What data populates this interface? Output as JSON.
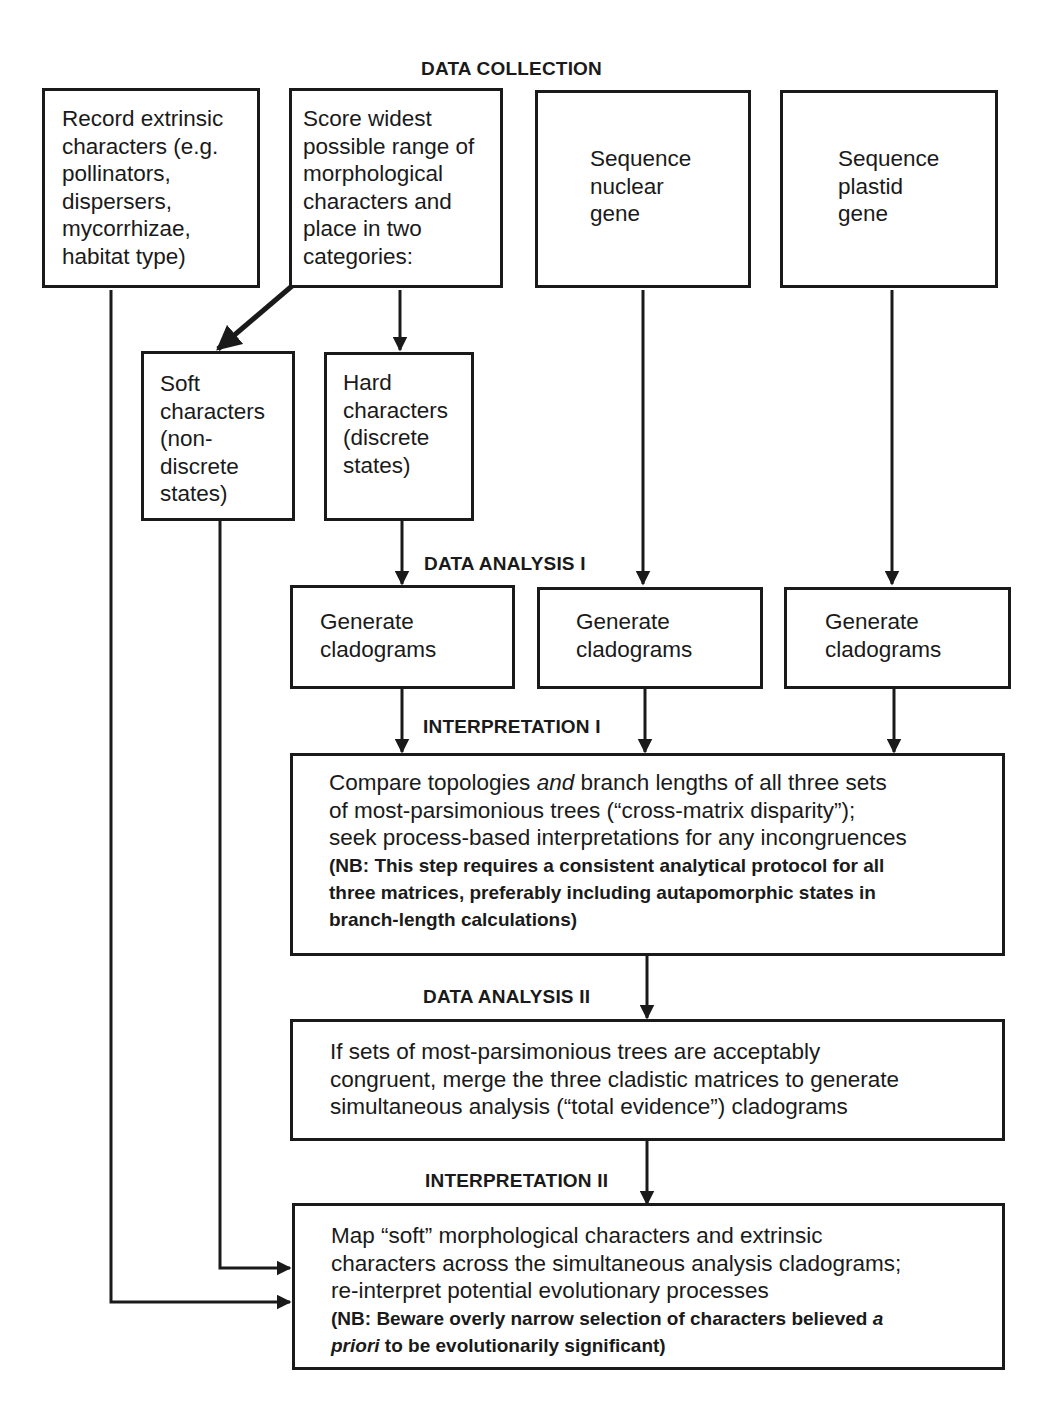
{
  "stages": {
    "data_collection": "DATA COLLECTION",
    "data_analysis_1": "DATA ANALYSIS I",
    "interpretation_1": "INTERPRETATION I",
    "data_analysis_2": "DATA ANALYSIS II",
    "interpretation_2": "INTERPRETATION II"
  },
  "boxes": {
    "extrinsic": "Record extrinsic\ncharacters (e.g.\npollinators,\ndispersers,\nmycorrhizae,\nhabitat type)",
    "morphological": "Score widest\npossible range of\nmorphological\ncharacters and\nplace in two\ncategories:",
    "nuclear": "Sequence\nnuclear\ngene",
    "plastid": "Sequence\nplastid\ngene",
    "soft": "Soft\ncharacters\n(non-\ndiscrete\nstates)",
    "hard": "Hard\ncharacters\n(discrete\nstates)",
    "cladograms_1": "Generate\ncladograms",
    "cladograms_2": "Generate\ncladograms",
    "cladograms_3": "Generate\ncladograms",
    "compare": {
      "pre": "Compare topologies ",
      "italic": "and",
      "post": " branch lengths of all three sets\nof most-parsimonious trees (“cross-matrix disparity”);\nseek process-based interpretations for any incongruences",
      "nb": "(NB: This step requires a consistent analytical protocol for all\nthree matrices, preferably including autapomorphic states in\nbranch-length calculations)"
    },
    "merge": "If sets of most-parsimonious trees are acceptably\ncongruent, merge the three cladistic matrices to generate\nsimultaneous analysis (“total evidence”) cladograms",
    "map": {
      "main": "Map “soft” morphological characters and extrinsic\ncharacters across the simultaneous analysis cladograms;\nre-interpret potential evolutionary processes",
      "nb_pre": "(NB: Beware overly narrow selection of characters believed ",
      "nb_italic_1": "a",
      "nb_break": "",
      "nb_italic_2": "priori",
      "nb_post": " to be evolutionarily significant)"
    }
  }
}
